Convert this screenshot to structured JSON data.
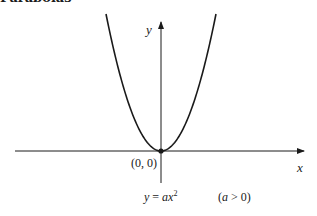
{
  "heading": "Parabolas",
  "axes": {
    "x_label": "x",
    "y_label": "y"
  },
  "vertex_label": "(0, 0)",
  "equation": {
    "lhs": "y",
    "eq": " = ",
    "coef": "a",
    "var": "x",
    "exp": "2"
  },
  "condition": "(a > 0)",
  "colors": {
    "stroke": "#1a1a1a",
    "background": "#ffffff"
  }
}
